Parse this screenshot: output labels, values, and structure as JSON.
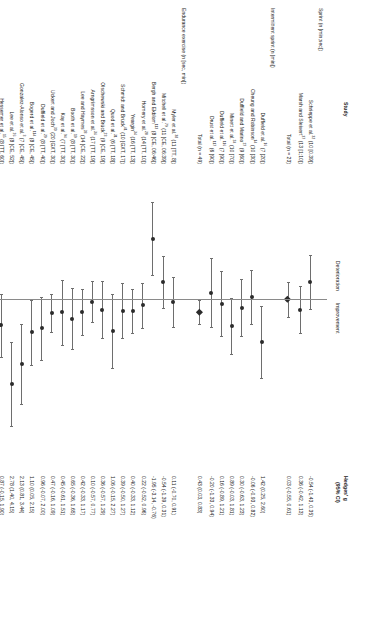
{
  "figure": {
    "type": "forest-plot",
    "orientation": "rotated-90-clockwise",
    "headers": {
      "study": "Study",
      "effect_line1": "Hedges' g",
      "effect_line2": "(95% CI)"
    },
    "direction_labels": {
      "left": "Deterioration",
      "right": "Improvement"
    }
  },
  "chart_data": {
    "type": "forest",
    "title": "",
    "xlabel": "Hedges' g",
    "ylabel": "",
    "xlim": [
      -4,
      5
    ],
    "xticks": [
      -4,
      -3,
      -2,
      -1,
      0,
      1,
      2,
      3,
      4,
      5
    ],
    "xticklabels": [
      "-4",
      "-3",
      "-2",
      "-1",
      "0",
      "1",
      "2",
      "3",
      "4",
      "5"
    ],
    "reference_line": 0,
    "grid": false,
    "legend": "none",
    "groups": [
      {
        "name": "Sprint (n [min;sec])",
        "rows": [
          {
            "label": "Schrieppe et al.",
            "sup": "32",
            "detail": "(10 [0.39])",
            "g": -0.54,
            "lo": -1.43,
            "hi": 0.35,
            "ci_text": "-0.54 (-1.43, 0.35)",
            "type": "study"
          },
          {
            "label": "Marsh and Sleivert",
            "sup": "37",
            "detail": "(13 [1;10])",
            "g": 0.36,
            "lo": -0.42,
            "hi": 1.13,
            "ci_text": "0.36 (-0.42, 1.13)",
            "type": "study"
          }
        ],
        "total": {
          "label": "Total (n = 23)",
          "g": 0.03,
          "lo": -0.55,
          "hi": 0.61,
          "ci_text": "0.03 (-0.55, 0.61)",
          "type": "summary"
        }
      },
      {
        "name": "Intermittent sprint (n [min])",
        "rows": [
          {
            "label": "Duffield et al.",
            "sup": "16",
            "detail": "(7 [20])",
            "g": 1.42,
            "lo": 0.25,
            "hi": 2.6,
            "ci_text": "1.42 (0.25, 2.60)",
            "type": "study"
          },
          {
            "label": "Cheung and Robinson",
            "sup": "14",
            "detail": "(10 [30])",
            "g": -0.06,
            "lo": -0.93,
            "hi": 0.82,
            "ci_text": "-0.06 (-0.93, 0.82)",
            "type": "study"
          },
          {
            "label": "Duffield and Marino",
            "sup": "27",
            "detail": "(9 [60])",
            "g": 0.3,
            "lo": -0.63,
            "hi": 1.23,
            "ci_text": "0.30 (-0.63, 1.23)",
            "type": "study"
          },
          {
            "label": "Minett et al.",
            "sup": "24",
            "detail": "(10 [70])",
            "g": 0.89,
            "lo": -0.03,
            "hi": 1.81,
            "ci_text": "0.89 (-0.03, 1.81)",
            "type": "study"
          },
          {
            "label": "Duffield et al.",
            "sup": "116",
            "detail": "(7 [90])",
            "g": 0.16,
            "lo": -0.89,
            "hi": 1.21,
            "ci_text": "0.16 (-0.89, 1.21)",
            "type": "study"
          },
          {
            "label": "Drust et al.",
            "sup": "117",
            "detail": "(6 [90])",
            "g": -0.2,
            "lo": -1.33,
            "hi": 0.94,
            "ci_text": "-0.20 (-1.33, 0.94)",
            "type": "study"
          }
        ],
        "total": {
          "label": "Total (n = 49)",
          "g": 0.43,
          "lo": 0.03,
          "hi": 0.83,
          "ci_text": "0.43 (0.03, 0.83)",
          "type": "summary"
        }
      },
      {
        "name": "Endurance exercise (n [sec, min])",
        "rows": [
          {
            "label": "Myler et al.",
            "sup": "38",
            "detail": "(11 [TT, 8])",
            "g": 0.11,
            "lo": -0.7,
            "hi": 0.91,
            "ci_text": "0.11 (-0.70, 0.91)",
            "type": "study"
          },
          {
            "label": "Mitchell et al.",
            "sup": "79",
            "detail": "(11 [CE, 06:39])",
            "g": -0.54,
            "lo": -1.39,
            "hi": 0.31,
            "ci_text": "-0.54 (-1.39, 0.31)",
            "type": "study"
          },
          {
            "label": "Bergh and Ekblom",
            "sup": "113",
            "detail": "(8 [CE, 06:46])",
            "g": -1.95,
            "lo": -3.14,
            "hi": -0.76,
            "ci_text": "-1.95 (-3.14, -0.76)",
            "type": "study"
          },
          {
            "label": "Homery et al.",
            "sup": "20",
            "detail": "(14 [TT, 10])",
            "g": 0.22,
            "lo": -0.52,
            "hi": 0.96,
            "ci_text": "0.22 (-0.52, 0.96)",
            "type": "study"
          },
          {
            "label": "Yeargin",
            "sup": "34",
            "detail": "(16 [TT, 13])",
            "g": 0.4,
            "lo": -0.33,
            "hi": 1.12,
            "ci_text": "0.40 (-0.33, 1.12)",
            "type": "study"
          },
          {
            "label": "Schmidt and Brück",
            "sup": "41",
            "detail": "(10 [GXT, 17])",
            "g": 0.39,
            "lo": -0.5,
            "hi": 1.27,
            "ci_text": "0.39 (-0.50, 1.27)",
            "type": "study"
          },
          {
            "label": "Quod et al.",
            "sup": "31",
            "detail": "(6 [TT, 18])",
            "g": 1.06,
            "lo": -0.15,
            "hi": 2.27,
            "ci_text": "1.06 (-0.15, 2.27)",
            "type": "study"
          },
          {
            "label": "Olschewski and Brück",
            "sup": "23",
            "detail": "(9 [CE, 19])",
            "g": 0.36,
            "lo": -0.57,
            "hi": 1.29,
            "ci_text": "0.36 (-0.57, 1.29)",
            "type": "study"
          },
          {
            "label": "Arngrímsson et al.",
            "sup": "36",
            "detail": "(17 [TT, 19])",
            "g": 0.1,
            "lo": -0.57,
            "hi": 0.77,
            "ci_text": "0.10 (-0.57, 0.77)",
            "type": "study"
          },
          {
            "label": "Lee and Haymes",
            "sup": "28",
            "detail": "(14 [CE, 22])",
            "g": 0.42,
            "lo": -0.33,
            "hi": 1.17,
            "ci_text": "0.42 (-0.33, 1.17)",
            "type": "study"
          },
          {
            "label": "Booth et al.",
            "sup": "19",
            "detail": "(8 [TT, 30])",
            "g": 0.65,
            "lo": -0.36,
            "hi": 1.65,
            "ci_text": "0.65 (-0.36, 1.65)",
            "type": "study"
          },
          {
            "label": "Kay et al.",
            "sup": "94",
            "detail": "(7 [TT, 30])",
            "g": 0.45,
            "lo": -0.61,
            "hi": 1.51,
            "ci_text": "0.45 (-0.61, 1.51)",
            "type": "study"
          },
          {
            "label": "Uckert and Joch",
            "sup": "30",
            "detail": "(20 [GXT, 30])",
            "g": 0.47,
            "lo": -0.16,
            "hi": 1.09,
            "ci_text": "0.47 (-0.16, 1.09)",
            "type": "study"
          },
          {
            "label": "Duffield et al.",
            "sup": "29",
            "detail": "(8 [TT, 40])",
            "g": 0.96,
            "lo": -0.07,
            "hi": 2.0,
            "ci_text": "0.96 (-0.07, 2.00)",
            "type": "study"
          },
          {
            "label": "Bogerd et al.",
            "sup": "114",
            "detail": "(8 [CE, 45])",
            "g": 1.1,
            "lo": 0.05,
            "hi": 2.15,
            "ci_text": "1.10 (0.05, 2.15)",
            "type": "study"
          },
          {
            "label": "Gonzalez-Alonso et al.",
            "sup": "3",
            "detail": "(7 [CE, 45])",
            "g": 2.13,
            "lo": 0.81,
            "hi": 3.44,
            "ci_text": "2.13 (0.81, 3.44)",
            "type": "study"
          },
          {
            "label": "Lee et al.",
            "sup": "26",
            "detail": "(8 [CE, 52])",
            "g": 2.78,
            "lo": 1.4,
            "hi": 4.15,
            "ci_text": "2.78 (1.40, 4.15)",
            "type": "study"
          },
          {
            "label": "Hessemer et al.",
            "sup": "15",
            "detail": "(8 [TT, 60])",
            "g": 0.87,
            "lo": -0.15,
            "hi": 1.9,
            "ci_text": "0.87 (-0.15, 1.90)",
            "type": "study"
          },
          {
            "label": "Ihsan et al.",
            "sup": "33",
            "detail": "(7 [TT, 89])",
            "g": 0.43,
            "lo": -0.63,
            "hi": 1.49,
            "ci_text": "0.43 (-0.63, 1.49)",
            "type": "study"
          }
        ],
        "total": null
      }
    ],
    "grand_total": {
      "label": "Total (n = 197)",
      "g": 0.46,
      "lo": 0.25,
      "hi": 0.66,
      "ci_text": "0.46 (0.25, 0.66)",
      "type": "summary"
    }
  }
}
